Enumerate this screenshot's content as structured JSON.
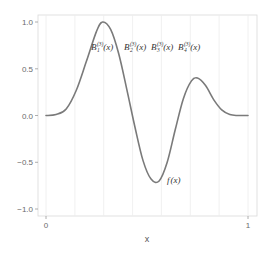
{
  "chart_data": {
    "type": "line",
    "title": "",
    "xlabel": "x",
    "ylabel": "",
    "xlim": [
      0,
      1
    ],
    "ylim": [
      -1.05,
      1.05
    ],
    "x_ticks": [
      0,
      1
    ],
    "x_tick_labels": [
      "0",
      "1"
    ],
    "y_ticks": [
      1.0,
      0.5,
      0.0,
      -0.5,
      -1.0
    ],
    "y_tick_labels": [
      "1.0",
      "0.5",
      "0.0",
      "-0.5",
      "-1.0"
    ],
    "grid": {
      "vertical": true,
      "horizontal": false,
      "vertical_positions": [
        0,
        0.142857,
        0.285714,
        0.428571,
        0.571429,
        0.714286,
        0.857143,
        1
      ]
    },
    "line_color": "#7a7a7a",
    "grid_color": "#e6e6e6",
    "series": [
      {
        "name": "f(x)",
        "x": [
          0.0,
          0.05,
          0.1,
          0.15,
          0.2,
          0.25,
          0.28,
          0.32,
          0.36,
          0.4,
          0.44,
          0.48,
          0.52,
          0.56,
          0.6,
          0.64,
          0.68,
          0.72,
          0.75,
          0.79,
          0.83,
          0.87,
          0.91,
          0.95,
          1.0
        ],
        "values": [
          0.0,
          0.01,
          0.07,
          0.27,
          0.58,
          0.9,
          1.0,
          0.92,
          0.66,
          0.28,
          -0.12,
          -0.48,
          -0.68,
          -0.7,
          -0.5,
          -0.15,
          0.18,
          0.37,
          0.4,
          0.32,
          0.17,
          0.06,
          0.01,
          0.0,
          0.0
        ]
      }
    ],
    "annotations": [
      {
        "text": "f(x)",
        "x": 0.63,
        "y": -0.72
      },
      {
        "text": "B_1^{(3)}(x)",
        "x": 0.26,
        "y": 0.72
      },
      {
        "text": "B_2^{(3)}(x)",
        "x": 0.45,
        "y": 0.72
      },
      {
        "text": "B_3^{(3)}(x)",
        "x": 0.6,
        "y": 0.72
      },
      {
        "text": "B_4^{(3)}(x)",
        "x": 0.75,
        "y": 0.72
      }
    ]
  },
  "labels": {
    "xlabel": "x",
    "f_label_main": "f",
    "f_label_arg": "(x)",
    "basis": [
      {
        "main": "B",
        "sup": "(3)",
        "sub": "1",
        "arg": "(x)"
      },
      {
        "main": "B",
        "sup": "(3)",
        "sub": "2",
        "arg": "(x)"
      },
      {
        "main": "B",
        "sup": "(3)",
        "sub": "3",
        "arg": "(x)"
      },
      {
        "main": "B",
        "sup": "(3)",
        "sub": "4",
        "arg": "(x)"
      }
    ],
    "yticks": [
      "1.0",
      "0.5",
      "0.0",
      "−0.5",
      "−1.0"
    ],
    "xticks": [
      "0",
      "1"
    ]
  }
}
